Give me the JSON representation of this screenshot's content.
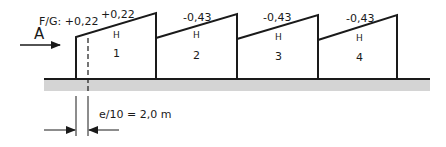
{
  "diagram": {
    "wind_direction_label": "A",
    "facade_label": "F/G: +0,22",
    "dimension_label": "e/10 = 2,0 m",
    "ground": {
      "color": "#d4d4d4"
    },
    "buildings": [
      {
        "number": "1",
        "coefficient": "+0,22",
        "zone": "H"
      },
      {
        "number": "2",
        "coefficient": "-0,43",
        "zone": "H"
      },
      {
        "number": "3",
        "coefficient": "-0,43",
        "zone": "H"
      },
      {
        "number": "4",
        "coefficient": "-0,43",
        "zone": "H"
      }
    ]
  }
}
